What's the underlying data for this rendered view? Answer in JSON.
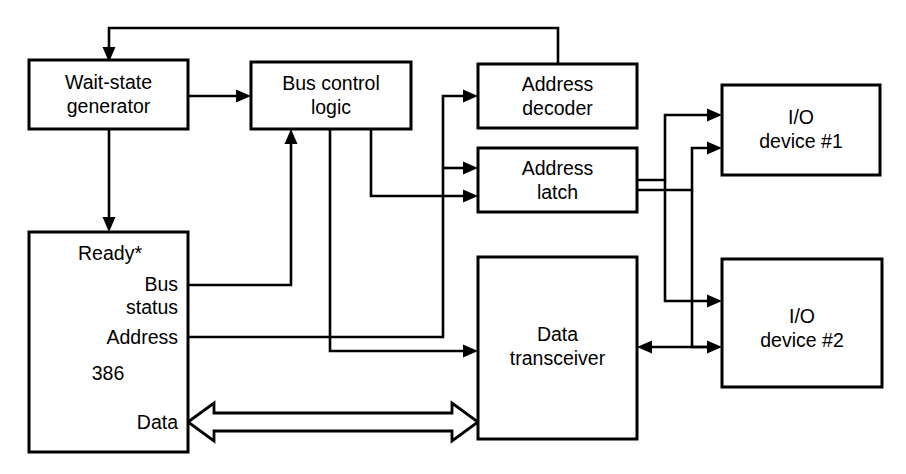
{
  "diagram": {
    "colors": {
      "line": "#000000",
      "background": "#ffffff",
      "box_fill": "#ffffff"
    },
    "blocks": [
      {
        "id": "wait_state",
        "label_line1": "Wait-state",
        "label_line2": "generator"
      },
      {
        "id": "bus_control",
        "label_line1": "Bus control",
        "label_line2": "logic"
      },
      {
        "id": "address_decoder",
        "label_line1": "Address",
        "label_line2": "decoder"
      },
      {
        "id": "address_latch",
        "label_line1": "Address",
        "label_line2": "latch"
      },
      {
        "id": "io_device_1",
        "label_line1": "I/O",
        "label_line2": "device #1"
      },
      {
        "id": "io_device_2",
        "label_line1": "I/O",
        "label_line2": "device #2"
      },
      {
        "id": "data_transceiver",
        "label_line1": "Data",
        "label_line2": "transceiver"
      },
      {
        "id": "cpu_386",
        "label": "386"
      }
    ],
    "cpu_pins": [
      {
        "id": "ready",
        "label": "Ready*"
      },
      {
        "id": "bus_status_line1",
        "label": "Bus"
      },
      {
        "id": "bus_status_line2",
        "label": "status"
      },
      {
        "id": "address",
        "label": "Address"
      },
      {
        "id": "chip",
        "label": "386"
      },
      {
        "id": "data",
        "label": "Data"
      }
    ],
    "connections": [
      {
        "from": "address_decoder",
        "to": "wait_state",
        "kind": "feedback-arrow"
      },
      {
        "from": "wait_state",
        "to": "bus_control",
        "kind": "arrow"
      },
      {
        "from": "wait_state",
        "to": "cpu_386",
        "kind": "arrow"
      },
      {
        "from": "cpu_386.bus_status",
        "to": "bus_control",
        "kind": "arrow"
      },
      {
        "from": "cpu_386.address",
        "to": "address_decoder",
        "kind": "arrow"
      },
      {
        "from": "cpu_386.address",
        "to": "address_latch",
        "kind": "arrow"
      },
      {
        "from": "bus_control",
        "to": "address_latch",
        "kind": "arrow"
      },
      {
        "from": "bus_control",
        "to": "data_transceiver",
        "kind": "arrow"
      },
      {
        "from": "address_latch",
        "to": "io_device_1",
        "kind": "arrow"
      },
      {
        "from": "address_latch",
        "to": "io_device_2",
        "kind": "arrow"
      },
      {
        "from": "address_decoder",
        "to": "io_device_1",
        "kind": "arrow"
      },
      {
        "from": "address_decoder",
        "to": "io_device_2",
        "kind": "arrow"
      },
      {
        "from": "data_transceiver",
        "to": "io_device_2",
        "kind": "bidirectional-arrow"
      },
      {
        "from": "cpu_386.data",
        "to": "data_transceiver",
        "kind": "hollow-bidirectional-bus"
      }
    ]
  }
}
